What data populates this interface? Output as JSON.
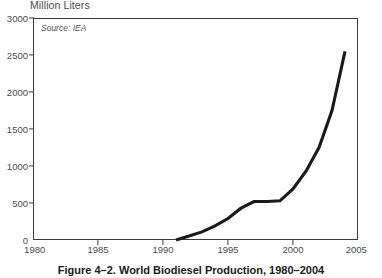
{
  "figure": {
    "caption": "Figure 4–2. World Biodiesel Production, 1980–2004",
    "source_note": "Source: IEA",
    "axis_title": "Million Liters"
  },
  "chart_data": {
    "type": "line",
    "title": "Million Liters",
    "xlabel": "",
    "ylabel": "Million Liters",
    "xlim": [
      1980,
      2005
    ],
    "ylim": [
      0,
      3000
    ],
    "grid": false,
    "legend": "none",
    "line_color": "#1a1a1a",
    "frame_color": "#3a3a3a",
    "xticks": [
      1980,
      1985,
      1990,
      1995,
      2000,
      2005
    ],
    "yticks": [
      0,
      500,
      1000,
      1500,
      2000,
      2500,
      3000
    ],
    "x": [
      1991,
      1992,
      1993,
      1994,
      1995,
      1996,
      1997,
      1998,
      1999,
      2000,
      2001,
      2002,
      2003,
      2004
    ],
    "values": [
      0,
      55,
      110,
      190,
      290,
      430,
      520,
      520,
      530,
      690,
      930,
      1250,
      1750,
      2550
    ],
    "annotations": [
      "Source: IEA"
    ]
  }
}
